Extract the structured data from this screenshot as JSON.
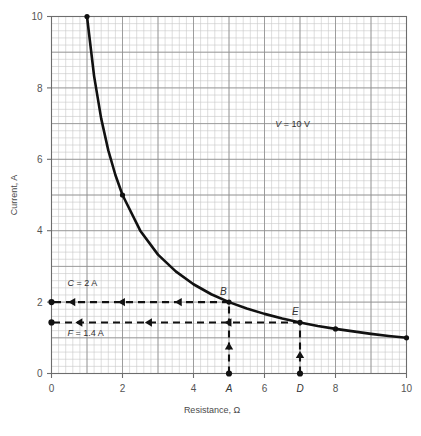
{
  "chart_data": {
    "type": "line",
    "title": "",
    "xlabel": "Resistance, Ω",
    "ylabel": "Current, A",
    "xlim": [
      0,
      10
    ],
    "ylim": [
      0,
      10
    ],
    "grid": true,
    "grid_minor_step": 0.2,
    "grid_major_step": 1,
    "xticks": [
      0,
      2,
      4,
      6,
      8,
      10
    ],
    "xtick_labels": [
      "0",
      "2",
      "4",
      "6",
      "8",
      "10"
    ],
    "yticks": [
      0,
      2,
      4,
      6,
      8,
      10
    ],
    "ytick_labels": [
      "0",
      "2",
      "4",
      "6",
      "8",
      "10"
    ],
    "legend": null,
    "series": [
      {
        "name": "I = V / R",
        "relation": "I = 10 / R",
        "x": [
          1,
          1.2,
          1.4,
          1.6,
          1.8,
          2,
          2.5,
          3,
          3.5,
          4,
          4.5,
          5,
          5.5,
          6,
          6.5,
          7,
          7.5,
          8,
          8.5,
          9,
          9.5,
          10
        ],
        "y": [
          10,
          8.33,
          7.14,
          6.25,
          5.56,
          5,
          4,
          3.33,
          2.86,
          2.5,
          2.22,
          2,
          1.82,
          1.67,
          1.54,
          1.43,
          1.33,
          1.25,
          1.18,
          1.11,
          1.05,
          1
        ]
      }
    ],
    "markers": [
      {
        "x": 1,
        "y": 10
      },
      {
        "x": 2,
        "y": 5
      },
      {
        "x": 5,
        "y": 2
      },
      {
        "x": 7,
        "y": 1.43
      },
      {
        "x": 8,
        "y": 1.25
      },
      {
        "x": 10,
        "y": 1
      }
    ],
    "annotations": [
      {
        "name": "voltage-note",
        "text_italic": "V",
        "text": " = 10 V",
        "x": 6.3,
        "y": 7.0
      },
      {
        "name": "point-C-note",
        "text_italic": "C",
        "text": " = 2 A",
        "x": 0.45,
        "y": 2.45
      },
      {
        "name": "point-F-note",
        "text_italic": "F",
        "text": " = 1.4 A",
        "x": 0.45,
        "y": 1.05
      },
      {
        "name": "point-B",
        "text": "B",
        "x": 5.0,
        "y": 2.0
      },
      {
        "name": "point-E",
        "text": "E",
        "x": 7.0,
        "y": 1.43
      },
      {
        "name": "point-A",
        "text": "A",
        "x": 5.0,
        "y": 0
      },
      {
        "name": "point-D",
        "text": "D",
        "x": 7.0,
        "y": 0
      }
    ],
    "construction_lines": [
      {
        "name": "A-to-B-vertical",
        "from": [
          5,
          0
        ],
        "to": [
          5,
          2
        ],
        "style": "dashed",
        "arrow": "up",
        "dot_at": "from"
      },
      {
        "name": "B-to-C-horizontal",
        "from": [
          5,
          2
        ],
        "to": [
          0,
          2
        ],
        "style": "dashed",
        "arrow": "left",
        "dot_at": "to"
      },
      {
        "name": "D-to-E-vertical",
        "from": [
          7,
          0
        ],
        "to": [
          7,
          1.43
        ],
        "style": "dashed",
        "arrow": "up",
        "dot_at": "from"
      },
      {
        "name": "E-to-F-horizontal",
        "from": [
          7,
          1.43
        ],
        "to": [
          0,
          1.43
        ],
        "style": "dashed",
        "arrow": "left",
        "dot_at": "to"
      }
    ],
    "colors": {
      "curve": "#111111",
      "construction": "#111111",
      "grid_minor": "#c8c8c8",
      "grid_major": "#8d8d8d",
      "axis": "#6d6d6d",
      "text": "#4a4a4a",
      "background": "#ffffff"
    }
  }
}
